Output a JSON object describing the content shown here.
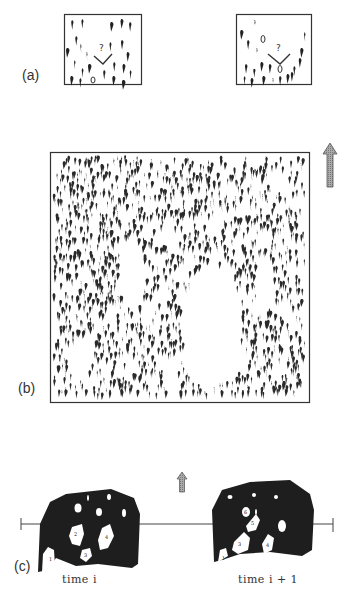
{
  "figure": {
    "panels": [
      {
        "id": "a",
        "label": "(a)",
        "description": "Two small boxes of swimming fish; a fish at center turns left or right with a question mark"
      },
      {
        "id": "b",
        "label": "(b)",
        "description": "Dense school of fish swimming upward with vacuoles (empty spaces)"
      },
      {
        "id": "c",
        "label": "(c)",
        "description": "School outline with numbered vacuoles at two successive times"
      }
    ],
    "panel_a": {
      "question_mark": "?"
    },
    "panel_c": {
      "time_labels": [
        "time i",
        "time i + 1"
      ],
      "vacuole_numbers_left": [
        "1",
        "2",
        "3",
        "4"
      ],
      "vacuole_numbers_right": [
        "1",
        "3",
        "4",
        "5",
        "6"
      ]
    },
    "direction_arrow": "up-arrow"
  }
}
